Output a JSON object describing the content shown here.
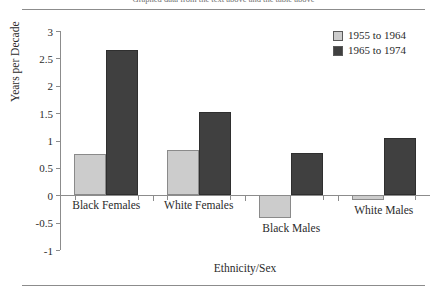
{
  "figure": {
    "clipped_caption": "Graphed data from the text above and the table above"
  },
  "chart_data": {
    "type": "bar",
    "title": "",
    "xlabel": "Ethnicity/Sex",
    "ylabel": "Years per Decade",
    "categories": [
      "Black Females",
      "White Females",
      "Black Males",
      "White Males"
    ],
    "series": [
      {
        "name": "1955 to 1964",
        "color": "#cccccc",
        "values": [
          0.75,
          0.82,
          -0.42,
          -0.08
        ]
      },
      {
        "name": "1965 to 1974",
        "color": "#404040",
        "values": [
          2.65,
          1.52,
          0.78,
          1.05
        ]
      }
    ],
    "ylim": [
      -1,
      3
    ],
    "ytick_labels": [
      "3",
      "2.5",
      "2",
      "1.5",
      "1",
      "0.5",
      "0",
      "-0.5",
      "-1"
    ],
    "ytick_values": [
      3,
      2.5,
      2,
      1.5,
      1,
      0.5,
      0,
      -0.5,
      -1
    ],
    "grid": false,
    "legend_position": "top-right"
  }
}
